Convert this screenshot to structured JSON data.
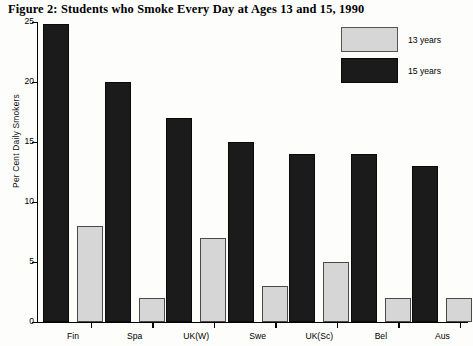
{
  "chart_data": {
    "type": "bar",
    "title": "Figure 2: Students who Smoke Every Day at Ages 13 and 15, 1990",
    "xlabel": "",
    "ylabel": "Per Cent Daily Smokers",
    "ylim": [
      0,
      25
    ],
    "yticks": [
      0,
      5,
      10,
      15,
      20,
      25
    ],
    "ytick_labels": [
      "0",
      "5",
      "10",
      "15",
      "20",
      "25"
    ],
    "grid": false,
    "legend_position": "top-right",
    "categories": [
      "Fin",
      "Spa",
      "UK(W)",
      "Swe",
      "UK(Sc)",
      "Bel",
      "Aus"
    ],
    "series": [
      {
        "name": "13 years",
        "color": "#d6d6d6",
        "values": [
          8,
          2,
          7,
          3,
          5,
          2,
          2
        ]
      },
      {
        "name": "15 years",
        "color": "#1b1b1b",
        "values": [
          24.8,
          20,
          17,
          15,
          14,
          14,
          13
        ]
      }
    ]
  },
  "legend": {
    "items": [
      {
        "label": "13 years",
        "style": "light"
      },
      {
        "label": "15 years",
        "style": "dark"
      }
    ]
  }
}
